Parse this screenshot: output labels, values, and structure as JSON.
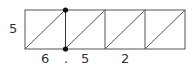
{
  "diagram": {
    "rect": {
      "x": 25,
      "y": 10,
      "width": 160,
      "height": 39
    },
    "dividers_x": [
      65,
      105,
      145
    ],
    "cells": [
      {
        "x1": 25,
        "x2": 65
      },
      {
        "x1": 65,
        "x2": 105
      },
      {
        "x1": 105,
        "x2": 145
      },
      {
        "x1": 145,
        "x2": 185
      }
    ],
    "points": [
      {
        "x": 65.5,
        "y": 10
      },
      {
        "x": 65.5,
        "y": 49
      }
    ],
    "colors": {
      "stroke": "#555555",
      "point": "#111111",
      "text": "#333333"
    }
  },
  "labels": {
    "height": "5",
    "bottom_1": "6",
    "bottom_dot": ".",
    "bottom_2": "5",
    "bottom_3": "2"
  }
}
